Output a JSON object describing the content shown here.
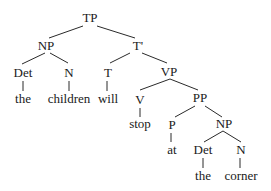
{
  "diagram": {
    "type": "syntax-tree",
    "nodes": {
      "tp": "TP",
      "np1": "NP",
      "tbar": "T'",
      "det1": "Det",
      "n1": "N",
      "t": "T",
      "vp": "VP",
      "v": "V",
      "pp": "PP",
      "p": "P",
      "np2": "NP",
      "det2": "Det",
      "n2": "N"
    },
    "words": {
      "the1": "the",
      "children": "children",
      "will": "will",
      "stop": "stop",
      "at": "at",
      "the2": "the",
      "corner": "corner"
    }
  }
}
